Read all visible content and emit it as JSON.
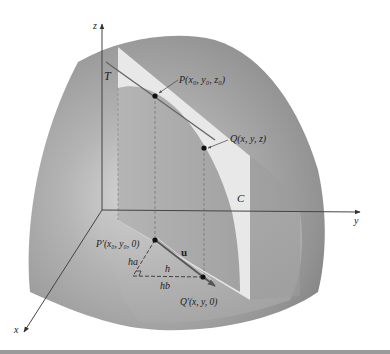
{
  "figure": {
    "axes": {
      "x_label": "x",
      "y_label": "y",
      "z_label": "z"
    },
    "labels": {
      "tangent_line": "T",
      "curve": "C",
      "point_P": "P(x₀, y₀, z₀)",
      "point_Q": "Q(x, y, z)",
      "point_P_prime": "P′(x₀, y₀, 0)",
      "point_Q_prime": "Q′(x, y, 0)",
      "unit_vector": "u",
      "leg_ha": "ha",
      "hypotenuse_h": "h",
      "leg_hb": "hb"
    },
    "colors": {
      "surface_dark": "#8a8a8a",
      "surface_mid": "#a8a8a8",
      "surface_light": "#cfcfcf",
      "plane": "#e6e6e6",
      "cut_region": "#b9b9b9",
      "axis": "#444444",
      "point": "#111111"
    }
  }
}
